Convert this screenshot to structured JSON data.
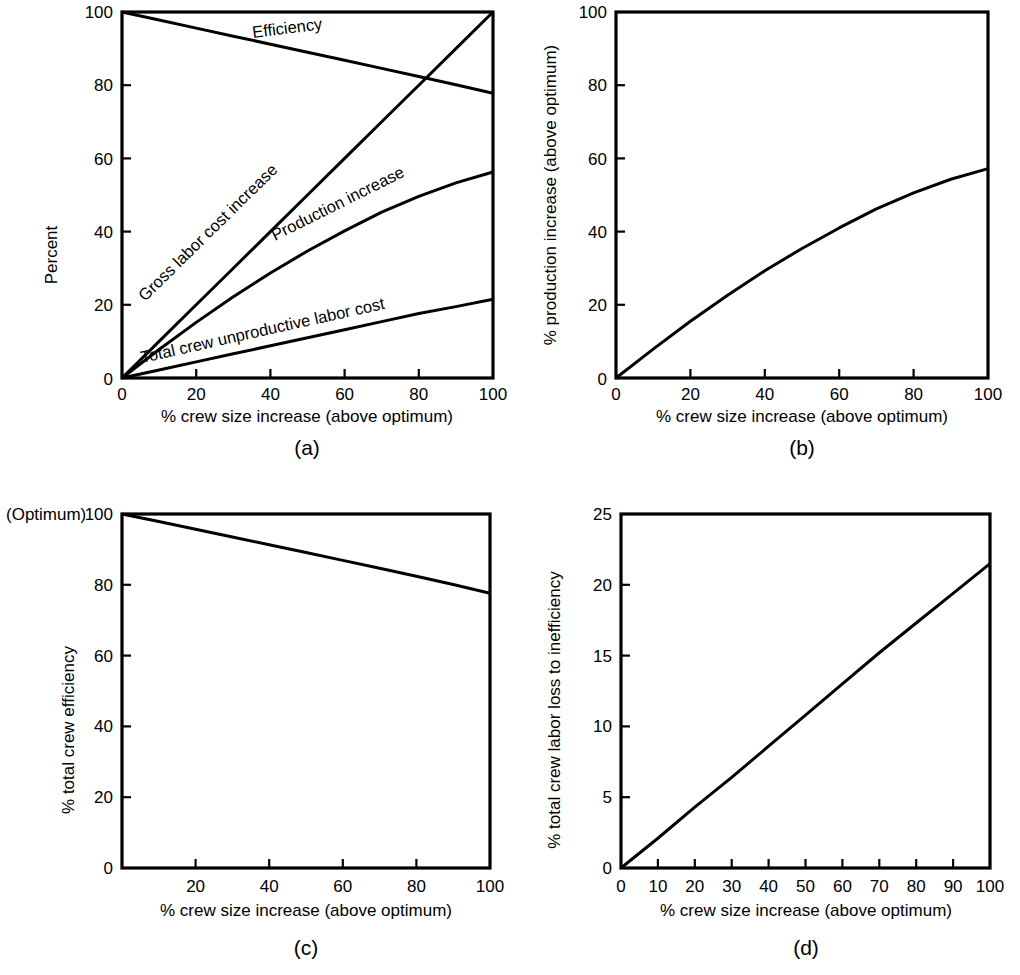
{
  "figure": {
    "background_color": "#ffffff",
    "line_color": "#000000",
    "panels": [
      {
        "id": "a",
        "caption": "(a)",
        "ylabel": "Percent",
        "xlabel": "% crew size increase (above optimum)",
        "xticks": [
          "0",
          "20",
          "40",
          "60",
          "80",
          "100"
        ],
        "yticks": [
          "0",
          "20",
          "40",
          "60",
          "80",
          "100"
        ],
        "curve_labels": {
          "efficiency": "Efficiency",
          "gross_labor": "Gross labor cost increase",
          "production": "Production increase",
          "unproductive": "Total crew unproductive labor cost"
        }
      },
      {
        "id": "b",
        "caption": "(b)",
        "ylabel": "% production increase (above optimum)",
        "xlabel": "% crew size increase (above optimum)",
        "xticks": [
          "0",
          "20",
          "40",
          "60",
          "80",
          "100"
        ],
        "yticks": [
          "0",
          "20",
          "40",
          "60",
          "80",
          "100"
        ]
      },
      {
        "id": "c",
        "caption": "(c)",
        "ylabel": "% total crew efficiency",
        "ylabel_prefix": "(Optimum)",
        "xlabel": "% crew size increase (above optimum)",
        "xticks": [
          "20",
          "40",
          "60",
          "80",
          "100"
        ],
        "yticks": [
          "0",
          "20",
          "40",
          "60",
          "80",
          "100"
        ]
      },
      {
        "id": "d",
        "caption": "(d)",
        "ylabel": "% total crew labor loss to inefficiency",
        "xlabel": "% crew size increase (above optimum)",
        "xticks": [
          "0",
          "10",
          "20",
          "30",
          "40",
          "50",
          "60",
          "70",
          "80",
          "90",
          "100"
        ],
        "yticks": [
          "0",
          "5",
          "10",
          "15",
          "20",
          "25"
        ]
      }
    ]
  },
  "chart_data": [
    {
      "type": "line",
      "panel": "a",
      "title": "",
      "xlabel": "% crew size increase (above optimum)",
      "ylabel": "Percent",
      "xlim": [
        0,
        100
      ],
      "ylim": [
        0,
        100
      ],
      "xticks": [
        0,
        20,
        40,
        60,
        80,
        100
      ],
      "yticks": [
        0,
        20,
        40,
        60,
        80,
        100
      ],
      "grid": false,
      "legend": "inline-curve-labels",
      "x": [
        0,
        10,
        20,
        30,
        40,
        50,
        60,
        70,
        80,
        90,
        100
      ],
      "series": [
        {
          "name": "Efficiency",
          "values": [
            100,
            97.8,
            95.6,
            93.4,
            91.2,
            89.0,
            86.8,
            84.6,
            82.4,
            80.1,
            77.8
          ]
        },
        {
          "name": "Gross labor cost increase",
          "values": [
            0,
            10,
            20,
            30,
            40,
            50,
            60,
            70,
            80,
            90,
            100
          ]
        },
        {
          "name": "Production increase",
          "values": [
            0,
            7.8,
            15.2,
            22.2,
            28.7,
            34.7,
            40.2,
            45.3,
            49.6,
            53.3,
            56.3
          ]
        },
        {
          "name": "Total crew unproductive labor cost",
          "values": [
            0,
            2.2,
            4.4,
            6.6,
            8.8,
            11.0,
            13.2,
            15.4,
            17.6,
            19.5,
            21.5
          ]
        }
      ],
      "annotations": [
        "Efficiency and Gross labor cost increase curves cross near 82% crew size increase at about 80.5%"
      ]
    },
    {
      "type": "line",
      "panel": "b",
      "title": "",
      "xlabel": "% crew size increase (above optimum)",
      "ylabel": "% production increase (above optimum)",
      "xlim": [
        0,
        100
      ],
      "ylim": [
        0,
        100
      ],
      "xticks": [
        0,
        20,
        40,
        60,
        80,
        100
      ],
      "yticks": [
        0,
        20,
        40,
        60,
        80,
        100
      ],
      "grid": false,
      "x": [
        0,
        10,
        20,
        30,
        40,
        50,
        60,
        70,
        80,
        90,
        100
      ],
      "values": [
        0,
        7.9,
        15.5,
        22.6,
        29.3,
        35.4,
        41.0,
        46.2,
        50.6,
        54.3,
        57.2
      ]
    },
    {
      "type": "line",
      "panel": "c",
      "title": "",
      "xlabel": "% crew size increase (above optimum)",
      "ylabel": "% total crew efficiency",
      "xlim": [
        0,
        100
      ],
      "ylim": [
        0,
        100
      ],
      "xticks": [
        20,
        40,
        60,
        80,
        100
      ],
      "yticks": [
        0,
        20,
        40,
        60,
        80,
        100
      ],
      "grid": false,
      "x": [
        0,
        10,
        20,
        30,
        40,
        50,
        60,
        70,
        80,
        90,
        100
      ],
      "values": [
        100,
        97.9,
        95.7,
        93.5,
        91.3,
        89.1,
        86.9,
        84.7,
        82.4,
        80.1,
        77.6
      ]
    },
    {
      "type": "line",
      "panel": "d",
      "title": "",
      "xlabel": "% crew size increase (above optimum)",
      "ylabel": "% total crew labor loss to inefficiency",
      "xlim": [
        0,
        100
      ],
      "ylim": [
        0,
        25
      ],
      "xticks": [
        0,
        10,
        20,
        30,
        40,
        50,
        60,
        70,
        80,
        90,
        100
      ],
      "yticks": [
        0,
        5,
        10,
        15,
        20,
        25
      ],
      "grid": false,
      "x": [
        0,
        10,
        20,
        30,
        40,
        50,
        60,
        70,
        80,
        90,
        100
      ],
      "values": [
        0,
        2.1,
        4.3,
        6.4,
        8.6,
        10.8,
        13.0,
        15.2,
        17.3,
        19.4,
        21.5
      ]
    }
  ]
}
